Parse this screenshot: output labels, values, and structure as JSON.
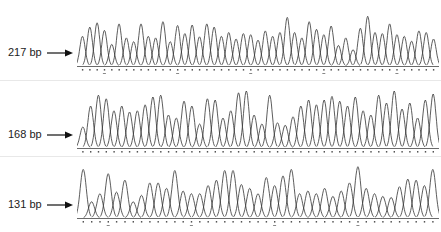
{
  "figure": {
    "panels": [
      {
        "label": "217 bp",
        "top": 8,
        "height": 70,
        "baseline": 58,
        "amps": [
          0.55,
          0.72,
          0.8,
          0.66,
          0.4,
          0.78,
          0.52,
          0.45,
          0.78,
          0.55,
          0.52,
          0.82,
          0.45,
          0.75,
          0.6,
          0.76,
          0.54,
          0.78,
          0.72,
          0.55,
          0.62,
          0.5,
          0.6,
          0.58,
          0.48,
          0.65,
          0.55,
          0.62,
          0.9,
          0.62,
          0.52,
          0.82,
          0.68,
          0.58,
          0.74,
          0.38,
          0.52,
          0.3,
          0.7,
          0.92,
          0.62,
          0.6,
          0.78,
          0.58,
          0.55,
          0.46,
          0.65,
          0.62,
          0.5
        ]
      },
      {
        "label": "168 bp",
        "top": 84,
        "height": 70,
        "baseline": 64,
        "amps": [
          0.35,
          0.7,
          0.88,
          0.82,
          0.62,
          0.7,
          0.6,
          0.62,
          0.72,
          0.85,
          0.88,
          0.55,
          0.5,
          0.78,
          0.7,
          0.4,
          0.82,
          0.8,
          0.5,
          0.62,
          0.92,
          0.95,
          0.55,
          0.4,
          0.88,
          0.42,
          0.38,
          0.52,
          0.7,
          0.8,
          0.72,
          0.8,
          0.86,
          0.78,
          0.7,
          0.85,
          0.62,
          0.55,
          0.88,
          0.75,
          0.95,
          0.65,
          0.75,
          0.5,
          0.8,
          0.9
        ]
      },
      {
        "label": "131 bp",
        "top": 160,
        "height": 72,
        "baseline": 58,
        "amps": [
          0.9,
          0.3,
          0.45,
          0.82,
          0.48,
          0.7,
          0.3,
          0.42,
          0.65,
          0.65,
          0.55,
          0.88,
          0.5,
          0.45,
          0.45,
          0.6,
          0.7,
          0.88,
          0.88,
          0.62,
          0.55,
          0.45,
          0.75,
          0.6,
          0.78,
          0.9,
          0.45,
          0.5,
          0.45,
          0.55,
          0.4,
          0.5,
          0.65,
          0.95,
          0.55,
          0.45,
          0.4,
          0.38,
          0.58,
          0.72,
          0.7,
          0.6,
          0.9
        ]
      }
    ]
  },
  "chart_data": {
    "type": "line",
    "title": "",
    "series": [
      {
        "name": "217 bp",
        "peaks_relative_height": [
          0.55,
          0.72,
          0.8,
          0.66,
          0.4,
          0.78,
          0.52,
          0.45,
          0.78,
          0.55,
          0.52,
          0.82,
          0.45,
          0.75,
          0.6,
          0.76,
          0.54,
          0.78,
          0.72,
          0.55,
          0.62,
          0.5,
          0.6,
          0.58,
          0.48,
          0.65,
          0.55,
          0.62,
          0.9,
          0.62,
          0.52,
          0.82,
          0.68,
          0.58,
          0.74,
          0.38,
          0.52,
          0.3,
          0.7,
          0.92,
          0.62,
          0.6,
          0.78,
          0.58,
          0.55,
          0.46,
          0.65,
          0.62,
          0.5
        ]
      },
      {
        "name": "168 bp",
        "peaks_relative_height": [
          0.35,
          0.7,
          0.88,
          0.82,
          0.62,
          0.7,
          0.6,
          0.62,
          0.72,
          0.85,
          0.88,
          0.55,
          0.5,
          0.78,
          0.7,
          0.4,
          0.82,
          0.8,
          0.5,
          0.62,
          0.92,
          0.95,
          0.55,
          0.4,
          0.88,
          0.42,
          0.38,
          0.52,
          0.7,
          0.8,
          0.72,
          0.8,
          0.86,
          0.78,
          0.7,
          0.85,
          0.62,
          0.55,
          0.88,
          0.75,
          0.95,
          0.65,
          0.75,
          0.5,
          0.8,
          0.9
        ]
      },
      {
        "name": "131 bp",
        "peaks_relative_height": [
          0.9,
          0.3,
          0.45,
          0.82,
          0.48,
          0.7,
          0.3,
          0.42,
          0.65,
          0.65,
          0.55,
          0.88,
          0.5,
          0.45,
          0.45,
          0.6,
          0.7,
          0.88,
          0.88,
          0.62,
          0.55,
          0.45,
          0.75,
          0.6,
          0.78,
          0.9,
          0.45,
          0.5,
          0.45,
          0.55,
          0.4,
          0.5,
          0.65,
          0.95,
          0.55,
          0.45,
          0.4,
          0.38,
          0.58,
          0.72,
          0.7,
          0.6,
          0.9
        ]
      }
    ],
    "annotations": [
      "217 bp",
      "168 bp",
      "131 bp"
    ],
    "xlabel": "",
    "ylabel": "",
    "grid": false,
    "legend": "none"
  }
}
